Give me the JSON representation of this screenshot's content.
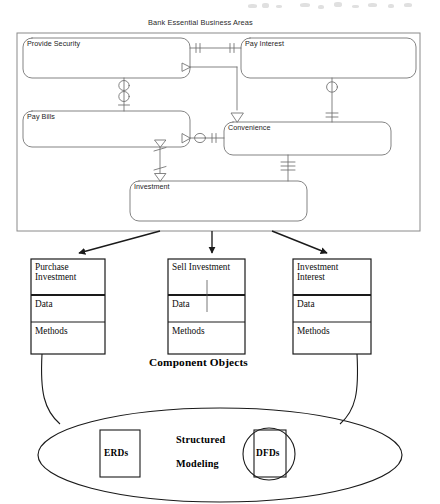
{
  "page": {
    "width": 440,
    "height": 504,
    "background": "#ffffff",
    "ink": "#111111",
    "figure_kind": "scanned methodology diagram"
  },
  "top_panel": {
    "title": "Bank Essential Business Areas",
    "frame": {
      "x": 17,
      "y": 33,
      "width": 403,
      "height": 198
    },
    "business_areas": [
      {
        "name": "Provide Security",
        "x": 23,
        "y": 38,
        "width": 167,
        "height": 40
      },
      {
        "name": "Pay Interest",
        "x": 241,
        "y": 38,
        "width": 175,
        "height": 40
      },
      {
        "name": "Pay Bills",
        "x": 23,
        "y": 111,
        "width": 167,
        "height": 36
      },
      {
        "name": "Convenience",
        "x": 224,
        "y": 122,
        "width": 167,
        "height": 33
      },
      {
        "name": "Investment",
        "x": 130,
        "y": 181,
        "width": 177,
        "height": 40
      }
    ],
    "relationships": [
      {
        "from": "Provide Security",
        "to": "Pay Interest",
        "notation": "one-to-one",
        "markers": [
          "double-bar",
          "double-bar"
        ]
      },
      {
        "from": "Provide Security",
        "to": "Pay Bills",
        "notation": "zero-or-one to zero-or-one",
        "markers": [
          "circle",
          "circle",
          "bar"
        ]
      },
      {
        "from": "Pay Interest",
        "to": "Convenience",
        "notation": "zero-or-one to one",
        "markers": [
          "circle",
          "double-bar"
        ]
      },
      {
        "from": "Pay Bills",
        "to": "Convenience",
        "notation": "many-to-zero-or-one",
        "markers": [
          "crows-foot",
          "circle",
          "double-bar"
        ]
      },
      {
        "from": "Pay Bills",
        "to": "Investment",
        "notation": "many-to-many",
        "markers": [
          "crows-foot",
          "crows-foot"
        ]
      },
      {
        "from": "Convenience",
        "to": "Investment",
        "notation": "mandatory one",
        "markers": [
          "triple-bar"
        ]
      },
      {
        "from": "Pay Interest",
        "to": "Convenience",
        "notation": "crows-foot inheritance",
        "markers": [
          "open-triangle"
        ]
      }
    ]
  },
  "component_objects": {
    "section_label": "Component Objects",
    "row_headers": [
      "Data",
      "Methods"
    ],
    "objects": [
      {
        "title_lines": [
          "Purchase",
          "Investment"
        ],
        "data_label": "Data",
        "methods_label": "Methods",
        "box": {
          "x": 31,
          "y": 259,
          "width": 74,
          "height": 95
        }
      },
      {
        "title_lines": [
          "Sell Investment"
        ],
        "data_label": "Data",
        "methods_label": "Methods",
        "box": {
          "x": 168,
          "y": 259,
          "width": 77,
          "height": 95
        }
      },
      {
        "title_lines": [
          "Investment",
          "Interest"
        ],
        "data_label": "Data",
        "methods_label": "Methods",
        "box": {
          "x": 293,
          "y": 259,
          "width": 78,
          "height": 95
        }
      }
    ]
  },
  "structured_modeling": {
    "label_lines": [
      "Structured",
      "Modeling"
    ],
    "ellipse": {
      "cx": 220,
      "cy": 455,
      "rx": 182,
      "ry": 47
    },
    "artifacts": [
      {
        "name": "ERDs",
        "shape": "rectangle",
        "x": 100,
        "y": 430,
        "width": 40,
        "height": 47
      },
      {
        "name": "DFDs",
        "shape": "circle-over-rectangle",
        "cx": 269,
        "cy": 454,
        "r": 26,
        "rect_x": 254,
        "rect_y": 430,
        "rect_width": 32,
        "rect_height": 47
      }
    ]
  }
}
